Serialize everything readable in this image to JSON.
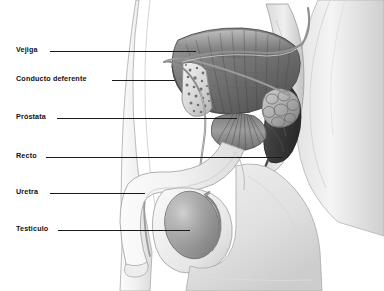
{
  "figure": {
    "style": "grayscale medical illustration",
    "background_color": "#ffffff",
    "label_color": "#111111",
    "leader_color": "#1a1a1a"
  },
  "labels": [
    {
      "id": "vejiga",
      "text": "Vejiga",
      "label_x": 16,
      "label_y": 46,
      "leader_x": 50,
      "leader_y": 51,
      "leader_w": 146
    },
    {
      "id": "conducto-deferente",
      "text": "Conducto deferente",
      "label_x": 16,
      "label_y": 75,
      "leader_x": 112,
      "leader_y": 80,
      "leader_w": 63
    },
    {
      "id": "prostata",
      "text": "Próstata",
      "label_x": 16,
      "label_y": 113,
      "leader_x": 57,
      "leader_y": 118,
      "leader_w": 180
    },
    {
      "id": "recto",
      "text": "Recto",
      "label_x": 16,
      "label_y": 152,
      "leader_x": 46,
      "leader_y": 157,
      "leader_w": 237
    },
    {
      "id": "uretra",
      "text": "Uretra",
      "label_x": 16,
      "label_y": 188,
      "leader_x": 50,
      "leader_y": 193,
      "leader_w": 95
    },
    {
      "id": "testiculo",
      "text": "Testiculo",
      "label_x": 16,
      "label_y": 225,
      "leader_x": 58,
      "leader_y": 230,
      "leader_w": 132
    }
  ],
  "structures": [
    {
      "name": "bladder",
      "label": "Vejiga"
    },
    {
      "name": "vas-deferens",
      "label": "Conducto deferente"
    },
    {
      "name": "prostate",
      "label": "Próstata"
    },
    {
      "name": "rectum",
      "label": "Recto"
    },
    {
      "name": "urethra",
      "label": "Uretra"
    },
    {
      "name": "testicle",
      "label": "Testiculo"
    },
    {
      "name": "pubic-bone",
      "label": ""
    },
    {
      "name": "seminal-vesicle",
      "label": ""
    },
    {
      "name": "penis-shaft",
      "label": ""
    },
    {
      "name": "scrotum",
      "label": ""
    },
    {
      "name": "sacrum",
      "label": ""
    },
    {
      "name": "abdominal-wall",
      "label": ""
    },
    {
      "name": "thigh",
      "label": ""
    }
  ]
}
